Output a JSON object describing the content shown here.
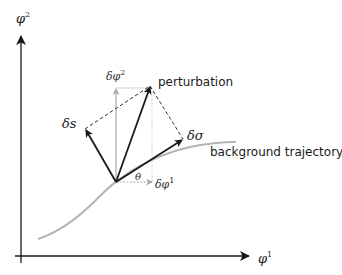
{
  "diagram": {
    "axes": {
      "x": {
        "symbol": "φ",
        "superscript": "1"
      },
      "y": {
        "symbol": "φ",
        "superscript": "2"
      }
    },
    "labels": {
      "perturbation": "perturbation",
      "background_trajectory": "background trajectory",
      "delta_s": {
        "prefix": "δ",
        "symbol": "s"
      },
      "delta_sigma": {
        "prefix": "δ",
        "symbol": "σ"
      },
      "delta_phi1": {
        "text": "δφ",
        "superscript": "1"
      },
      "delta_phi2": {
        "text": "δφ",
        "superscript": "2"
      },
      "theta": "θ"
    },
    "colors": {
      "arrows": "#1a1a1a",
      "trajectory": "#b4b4b4",
      "components": "#a8a8a8",
      "dashed": "#333333"
    }
  }
}
